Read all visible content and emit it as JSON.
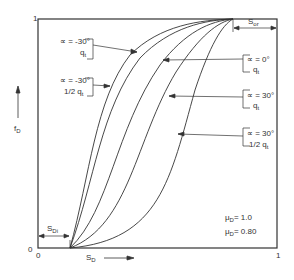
{
  "diagram": {
    "type": "fractional-flow-curves",
    "axes": {
      "x_label": "S",
      "x_label_sub": "D",
      "y_label": "f",
      "y_label_sub": "D",
      "x_origin_tick": "0",
      "y_origin_tick": "0",
      "x_max_tick": "1",
      "y_max_tick": "1"
    },
    "annotations": {
      "sdi_label": "S",
      "sdi_sub": "Di",
      "sor_label": "S",
      "sor_sub": "or",
      "mu1": "μ",
      "mu1_sub": "D",
      "mu1_value": "= 1.0",
      "mu2": "μ",
      "mu2_sub": "D",
      "mu2_value": "= 0.80"
    },
    "curves": [
      {
        "alpha": "∝ = -30°",
        "rate": "q",
        "rate_sub": "t"
      },
      {
        "alpha": "∝ = -30°",
        "rate": "1/2 q",
        "rate_sub": "t"
      },
      {
        "alpha": "∝ = 0°",
        "rate": "q",
        "rate_sub": "t"
      },
      {
        "alpha": "∝ = 30°",
        "rate": "q",
        "rate_sub": "t"
      },
      {
        "alpha": "∝ = 30°",
        "rate": "1/2 q",
        "rate_sub": "t"
      }
    ]
  }
}
